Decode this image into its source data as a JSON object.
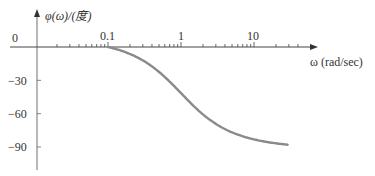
{
  "chart_data": {
    "type": "line",
    "title": "",
    "xlabel": "ω (rad/sec)",
    "ylabel": "φ(ω)/(度)",
    "xscale": "log",
    "xlim": [
      0.01,
      40
    ],
    "ylim": [
      -100,
      10
    ],
    "x_tick_labels": [
      "0.1",
      "1",
      "10"
    ],
    "y_tick_labels": [
      "0",
      "-30",
      "-60",
      "-90"
    ],
    "y_ticks": [
      0,
      -30,
      -60,
      -90
    ],
    "grid": false,
    "legend": null,
    "series": [
      {
        "name": "phase",
        "x": [
          0.1,
          0.2,
          0.3,
          0.5,
          0.7,
          1,
          1.5,
          2,
          3,
          5,
          7,
          10,
          15,
          20,
          30
        ],
        "values": [
          -5.7,
          -11.3,
          -16.7,
          -26.6,
          -35.0,
          -45.0,
          -56.3,
          -63.4,
          -71.6,
          -78.7,
          -81.9,
          -84.3,
          -86.2,
          -87.1,
          -88.1
        ]
      }
    ],
    "colors": {
      "curve": "#8a8a8a",
      "axis": "#555555"
    }
  },
  "labels": {
    "origin": "0",
    "y_axis": "φ(ω)/(度)",
    "x_axis": "ω (rad/sec)",
    "x_ticks": [
      "0.1",
      "1",
      "10"
    ],
    "y_ticks": [
      "−30",
      "−60",
      "−90"
    ]
  }
}
